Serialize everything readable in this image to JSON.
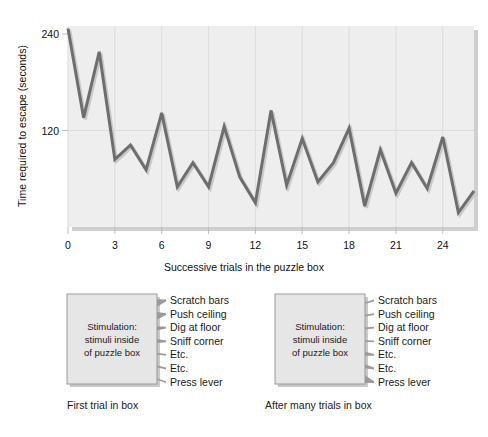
{
  "chart_data": {
    "type": "line",
    "title": "",
    "xlabel": "Successive trials in the puzzle box",
    "ylabel": "Time required to escape (seconds)",
    "xlim": [
      0,
      26
    ],
    "ylim": [
      0,
      250
    ],
    "xticks": [
      0,
      3,
      6,
      9,
      12,
      15,
      18,
      21,
      24
    ],
    "yticks": [
      120,
      240
    ],
    "grid": "vertical-at-xticks-plus-y120",
    "legend": "none",
    "line_color": "#6e6e6e",
    "plot_bg": "#eeeeee",
    "x": [
      0,
      1,
      2,
      3,
      4,
      5,
      6,
      7,
      8,
      9,
      10,
      11,
      12,
      13,
      14,
      15,
      16,
      17,
      18,
      19,
      20,
      21,
      22,
      23,
      24,
      25,
      26
    ],
    "values": [
      247,
      136,
      218,
      84,
      102,
      71,
      142,
      50,
      80,
      50,
      125,
      62,
      30,
      145,
      52,
      110,
      56,
      80,
      123,
      26,
      96,
      42,
      80,
      48,
      112,
      18,
      45
    ],
    "series": [
      {
        "name": "Time required to escape (seconds)",
        "values": [
          247,
          136,
          218,
          84,
          102,
          71,
          142,
          50,
          80,
          50,
          125,
          62,
          30,
          145,
          52,
          110,
          56,
          80,
          123,
          26,
          96,
          42,
          80,
          48,
          112,
          18,
          45
        ]
      }
    ],
    "ytick_labels": [
      "120",
      "240"
    ],
    "xtick_labels": [
      "0",
      "3",
      "6",
      "9",
      "12",
      "15",
      "18",
      "21",
      "24"
    ]
  },
  "diagrams": {
    "first": {
      "caption": "First trial in box",
      "box_lines": [
        "Stimulation:",
        "stimuli inside",
        "of puzzle box"
      ],
      "responses": [
        {
          "label": "Scratch bars",
          "weight": "thick"
        },
        {
          "label": "Push ceiling",
          "weight": "thick"
        },
        {
          "label": "Dig at floor",
          "weight": "medium"
        },
        {
          "label": "Sniff corner",
          "weight": "medium"
        },
        {
          "label": "Etc.",
          "weight": "thin"
        },
        {
          "label": "Etc.",
          "weight": "thin"
        },
        {
          "label": "Press lever",
          "weight": "thin"
        }
      ]
    },
    "after": {
      "caption": "After many trials in box",
      "box_lines": [
        "Stimulation:",
        "stimuli inside",
        "of puzzle box"
      ],
      "responses": [
        {
          "label": "Scratch bars",
          "weight": "thin"
        },
        {
          "label": "Push ceiling",
          "weight": "thin"
        },
        {
          "label": "Dig at floor",
          "weight": "thin"
        },
        {
          "label": "Sniff corner",
          "weight": "thin"
        },
        {
          "label": "Etc.",
          "weight": "medium"
        },
        {
          "label": "Etc.",
          "weight": "medium"
        },
        {
          "label": "Press lever",
          "weight": "thick"
        }
      ]
    }
  },
  "colors": {
    "line": "#6e6e6e",
    "plot_bg": "#eeeeee",
    "box_fill": "#e6e6e6",
    "box_stroke": "#9a9a9a",
    "arrow_fill": "#9a9a9a",
    "page_bg": "#ffffff",
    "text": "#1a1a1a"
  }
}
